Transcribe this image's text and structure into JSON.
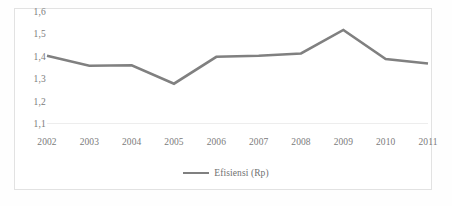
{
  "chart_data": {
    "type": "line",
    "title": "",
    "xlabel": "",
    "ylabel": "",
    "categories": [
      "2002",
      "2003",
      "2004",
      "2005",
      "2006",
      "2007",
      "2008",
      "2009",
      "2010",
      "2011"
    ],
    "series": [
      {
        "name": "Efisiensi (Rp)",
        "values": [
          1.405,
          1.36,
          1.362,
          1.28,
          1.4,
          1.405,
          1.415,
          1.52,
          1.39,
          1.37
        ],
        "color": "#808080"
      }
    ],
    "ylim": [
      1.1,
      1.6
    ],
    "y_ticks": [
      1.1,
      1.2,
      1.3,
      1.4,
      1.5,
      1.6
    ],
    "y_tick_labels": [
      "1,1",
      "1,2",
      "1,3",
      "1,4",
      "1,5",
      "1,6"
    ],
    "grid": false,
    "baseline_gridline": true,
    "legend_position": "bottom",
    "decimal_separator": ","
  },
  "legend": {
    "entries": [
      {
        "label": "Efisiensi (Rp)",
        "marker": "line-marker",
        "color": "#808080"
      }
    ]
  },
  "colors": {
    "series_line": "#808080",
    "tick_text": "#7b7b7b",
    "frame_border": "#e2e2e2",
    "gridline": "#ededed",
    "background": "#ffffff"
  }
}
